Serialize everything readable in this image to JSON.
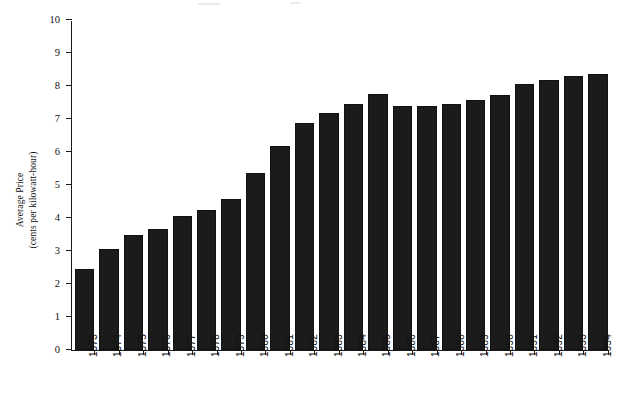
{
  "chart_data": {
    "type": "bar",
    "title": "",
    "subtitle": "",
    "xlabel": "",
    "ylabel_line1": "Average Price",
    "ylabel_line2": "(cents per kilowatt-hour)",
    "categories": [
      "1973",
      "1974",
      "1975",
      "1976",
      "1977",
      "1978",
      "1979",
      "1980",
      "1981",
      "1982",
      "1983",
      "1984",
      "1985",
      "1986",
      "1987",
      "1988",
      "1989",
      "1990",
      "1991",
      "1992",
      "1993",
      "1994"
    ],
    "values": [
      2.45,
      3.07,
      3.48,
      3.68,
      4.05,
      4.25,
      4.58,
      5.36,
      6.19,
      6.88,
      7.18,
      7.46,
      7.77,
      7.38,
      7.4,
      7.47,
      7.58,
      7.74,
      8.05,
      8.18,
      8.3,
      8.37
    ],
    "ylim": [
      0,
      10
    ],
    "yticks": [
      0,
      1,
      2,
      3,
      4,
      5,
      6,
      7,
      8,
      9,
      10
    ],
    "ytick_labels": [
      "0",
      "1",
      "2",
      "3",
      "4",
      "5",
      "6",
      "7",
      "8",
      "9",
      "10"
    ],
    "grid": false,
    "legend": false,
    "legend_position": "none",
    "bar_color": "#1b1b1b",
    "axis_color": "#1a1a1a",
    "background": "#ffffff"
  }
}
